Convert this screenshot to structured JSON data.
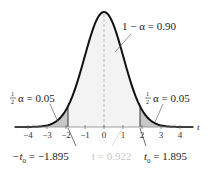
{
  "diagram": {
    "type": "t-distribution",
    "center_label": "1 − α = 0.90",
    "left_tail_label": {
      "frac_num": "1",
      "frac_den": "2",
      "text": "α = 0.05"
    },
    "right_tail_label": {
      "frac_num": "1",
      "frac_den": "2",
      "text": "α = 0.05"
    },
    "left_critical": {
      "prefix": "−t",
      "sub": "0",
      "text": " = −1.895",
      "value": -1.895
    },
    "right_critical": {
      "prefix": "t",
      "sub": "0",
      "text": " = 1.895",
      "value": 1.895
    },
    "test_stat": {
      "text": "t = 0.922",
      "value": 0.922
    },
    "axis_label": "t",
    "ticks": [
      "−4",
      "−3",
      "−2",
      "−1",
      "0",
      "1",
      "2",
      "3",
      "4"
    ],
    "colors": {
      "curve": "#111111",
      "tail_fill": "#c8c8c8",
      "center_fill": "#f3f3f3",
      "dashed_center": "#bbbbbb",
      "faint_text": "#c8c8c8"
    }
  }
}
